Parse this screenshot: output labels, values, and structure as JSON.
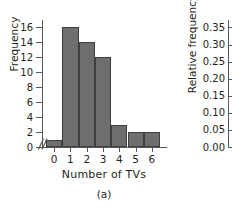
{
  "chart_data": {
    "type": "bar",
    "title": "",
    "caption": "(a)",
    "xlabel": "Number of TVs",
    "ylabel": "Frequency",
    "ylabel_secondary": "Relative frequency",
    "categories": [
      "0",
      "1",
      "2",
      "3",
      "4",
      "5",
      "6"
    ],
    "values": [
      1,
      16,
      14,
      12,
      3,
      2,
      2
    ],
    "relative_values": [
      0.02,
      0.32,
      0.28,
      0.24,
      0.06,
      0.04,
      0.04
    ],
    "xticks": [
      "0",
      "1",
      "2",
      "3",
      "4",
      "5",
      "6"
    ],
    "yticks": [
      "0",
      "2",
      "4",
      "6",
      "8",
      "10",
      "12",
      "14",
      "16"
    ],
    "ytick_values": [
      0,
      2,
      4,
      6,
      8,
      10,
      12,
      14,
      16
    ],
    "ylim": [
      0,
      17
    ],
    "yticks_secondary": [
      "0.00",
      "0.05",
      "0.10",
      "0.15",
      "0.20",
      "0.25",
      "0.30",
      "0.35"
    ],
    "ytick_values_secondary": [
      0.0,
      0.05,
      0.1,
      0.15,
      0.2,
      0.25,
      0.3,
      0.35
    ],
    "ylim_secondary": [
      0,
      0.3719
    ],
    "grid": false,
    "legend": "none",
    "axis_break": true,
    "bar_color": "#6e6e70",
    "bar_edge_color": "#3f3f41",
    "axis_color": "#59595b",
    "text_color": "#231f20",
    "background": "#ffffff"
  }
}
